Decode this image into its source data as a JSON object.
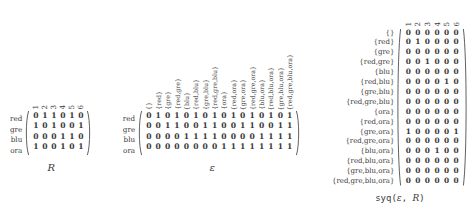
{
  "figure": {
    "blocks": [
      {
        "id": "R",
        "caption": "R",
        "caption_style": "italic",
        "row_labels": [
          "red",
          "gre",
          "blu",
          "ora"
        ],
        "col_labels": [
          "1",
          "2",
          "3",
          "4",
          "5",
          "6"
        ],
        "rows": [
          [
            "0",
            "1",
            "1",
            "0",
            "1",
            "0"
          ],
          [
            "1",
            "0",
            "1",
            "0",
            "0",
            "1"
          ],
          [
            "0",
            "0",
            "0",
            "1",
            "1",
            "0"
          ],
          [
            "1",
            "0",
            "0",
            "1",
            "0",
            "1"
          ]
        ]
      },
      {
        "id": "epsilon",
        "caption": "ε",
        "caption_style": "italic",
        "row_labels": [
          "red",
          "gre",
          "blu",
          "ora"
        ],
        "col_labels": [
          "{}",
          "{red}",
          "{gre}",
          "{red,gre}",
          "{blu}",
          "{red,blu}",
          "{gre,blu}",
          "{red,gre,blu}",
          "{ora}",
          "{red,ora}",
          "{gre,ora}",
          "{red,gre,ora}",
          "{blu,ora}",
          "{red,blu,ora}",
          "{gre,blu,ora}",
          "{red,gre,blu,ora}"
        ],
        "rows": [
          [
            "0",
            "1",
            "0",
            "1",
            "0",
            "1",
            "0",
            "1",
            "0",
            "1",
            "0",
            "1",
            "0",
            "1",
            "0",
            "1"
          ],
          [
            "0",
            "0",
            "1",
            "1",
            "0",
            "0",
            "1",
            "1",
            "0",
            "0",
            "1",
            "1",
            "0",
            "0",
            "1",
            "1"
          ],
          [
            "0",
            "0",
            "0",
            "0",
            "1",
            "1",
            "1",
            "1",
            "0",
            "0",
            "0",
            "0",
            "1",
            "1",
            "1",
            "1"
          ],
          [
            "0",
            "0",
            "0",
            "0",
            "0",
            "0",
            "0",
            "0",
            "1",
            "1",
            "1",
            "1",
            "1",
            "1",
            "1",
            "1"
          ]
        ]
      },
      {
        "id": "syq",
        "caption_prefix": "syq(",
        "caption_arg1": "ε",
        "caption_sep": ", ",
        "caption_arg2": "R",
        "caption_suffix": ")",
        "caption_style": "mono",
        "row_labels": [
          "{}",
          "{red}",
          "{gre}",
          "{red,gre}",
          "{blu}",
          "{red,blu}",
          "{gre,blu}",
          "{red,gre,blu}",
          "{ora}",
          "{red,ora}",
          "{gre,ora}",
          "{red,gre,ora}",
          "{blu,ora}",
          "{red,blu,ora}",
          "{gre,blu,ora}",
          "{red,gre,blu,ora}"
        ],
        "col_labels": [
          "1",
          "2",
          "3",
          "4",
          "5",
          "6"
        ],
        "rows": [
          [
            "0",
            "0",
            "0",
            "0",
            "0",
            "0"
          ],
          [
            "0",
            "1",
            "0",
            "0",
            "0",
            "0"
          ],
          [
            "0",
            "0",
            "0",
            "0",
            "0",
            "0"
          ],
          [
            "0",
            "0",
            "1",
            "0",
            "0",
            "0"
          ],
          [
            "0",
            "0",
            "0",
            "0",
            "0",
            "0"
          ],
          [
            "0",
            "0",
            "0",
            "0",
            "1",
            "0"
          ],
          [
            "0",
            "0",
            "0",
            "0",
            "0",
            "0"
          ],
          [
            "0",
            "0",
            "0",
            "0",
            "0",
            "0"
          ],
          [
            "0",
            "0",
            "0",
            "0",
            "0",
            "0"
          ],
          [
            "0",
            "0",
            "0",
            "0",
            "0",
            "0"
          ],
          [
            "1",
            "0",
            "0",
            "0",
            "0",
            "1"
          ],
          [
            "0",
            "0",
            "0",
            "0",
            "0",
            "0"
          ],
          [
            "0",
            "0",
            "0",
            "1",
            "0",
            "0"
          ],
          [
            "0",
            "0",
            "0",
            "0",
            "0",
            "0"
          ],
          [
            "0",
            "0",
            "0",
            "0",
            "0",
            "0"
          ],
          [
            "0",
            "0",
            "0",
            "0",
            "0",
            "0"
          ]
        ]
      }
    ]
  }
}
